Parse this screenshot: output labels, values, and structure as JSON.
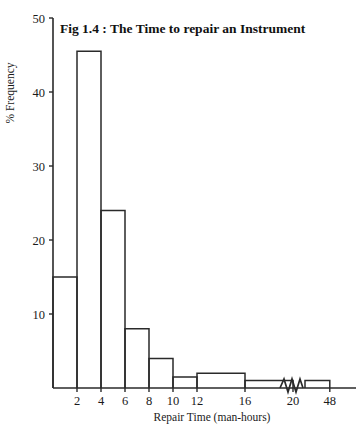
{
  "chart_data": {
    "type": "bar",
    "title": "Fig 1.4 : The Time to repair an Instrument",
    "xlabel": "Repair Time (man-hours)",
    "ylabel": "% Frequency",
    "grid": false,
    "legend": "none",
    "xlim": [
      0,
      50
    ],
    "ylim": [
      0,
      50
    ],
    "y_ticks": [
      10,
      20,
      30,
      40,
      50
    ],
    "y_tick_labels": [
      "10",
      "20",
      "30",
      "40",
      "50"
    ],
    "x_ticks": [
      2,
      4,
      6,
      8,
      10,
      12,
      16,
      20,
      48
    ],
    "x_tick_labels": [
      "2",
      "4",
      "6",
      "8",
      "10",
      "12",
      "16",
      "20",
      "48"
    ],
    "axis_break": {
      "present": true,
      "between": [
        20,
        48
      ],
      "style": "zigzag"
    },
    "categories": [
      "0-2",
      "2-4",
      "4-6",
      "6-8",
      "8-10",
      "10-12",
      "12-16",
      "16-20",
      "20-48"
    ],
    "bins": [
      {
        "label": "0-2",
        "x0": 0,
        "x1": 2,
        "value": 15.0
      },
      {
        "label": "2-4",
        "x0": 2,
        "x1": 4,
        "value": 45.5
      },
      {
        "label": "4-6",
        "x0": 4,
        "x1": 6,
        "value": 24.0
      },
      {
        "label": "6-8",
        "x0": 6,
        "x1": 8,
        "value": 8.0
      },
      {
        "label": "8-10",
        "x0": 8,
        "x1": 10,
        "value": 4.0
      },
      {
        "label": "10-12",
        "x0": 10,
        "x1": 12,
        "value": 1.5
      },
      {
        "label": "12-16",
        "x0": 12,
        "x1": 16,
        "value": 2.0
      },
      {
        "label": "16-20",
        "x0": 16,
        "x1": 20,
        "value": 1.0
      },
      {
        "label": "44-48",
        "x0": 44,
        "x1": 48,
        "value": 1.0
      }
    ],
    "values": [
      15.0,
      45.5,
      24.0,
      8.0,
      4.0,
      1.5,
      2.0,
      1.0,
      1.0
    ],
    "colors": {
      "bar_stroke": "#2a2a2a",
      "bar_fill": "none",
      "axis": "#2a2a2a",
      "text": "#1a1a1a",
      "background": "#ffffff"
    }
  }
}
